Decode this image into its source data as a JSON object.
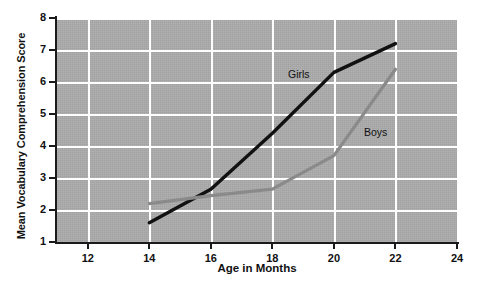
{
  "chart_data": {
    "type": "line",
    "title": "",
    "xlabel": "Age in Months",
    "ylabel": "Mean Vocabulary Comprehension Score",
    "xlim": [
      11,
      24
    ],
    "ylim": [
      1,
      8
    ],
    "xticks": [
      12,
      14,
      16,
      18,
      20,
      22,
      24
    ],
    "yticks": [
      1,
      2,
      3,
      4,
      5,
      6,
      7,
      8
    ],
    "xtick_labels": [
      "12",
      "14",
      "16",
      "18",
      "20",
      "22",
      "24"
    ],
    "ytick_labels": [
      "1",
      "2",
      "3",
      "4",
      "5",
      "6",
      "7",
      "8"
    ],
    "grid": true,
    "legend": "inline-annotations",
    "plot_background": "#ababab",
    "gridline_color": "#ffffff",
    "x": [
      14,
      16,
      18,
      20,
      22
    ],
    "series": [
      {
        "name": "Girls",
        "color": "#111111",
        "width": 3.4,
        "values": [
          1.6,
          2.65,
          4.4,
          6.3,
          7.2
        ],
        "label_x": 288,
        "label_y": 68
      },
      {
        "name": "Boys",
        "color": "#8a8a8a",
        "width": 3.2,
        "values": [
          2.2,
          2.45,
          2.65,
          3.7,
          6.4
        ],
        "label_x": 364,
        "label_y": 126
      }
    ]
  }
}
